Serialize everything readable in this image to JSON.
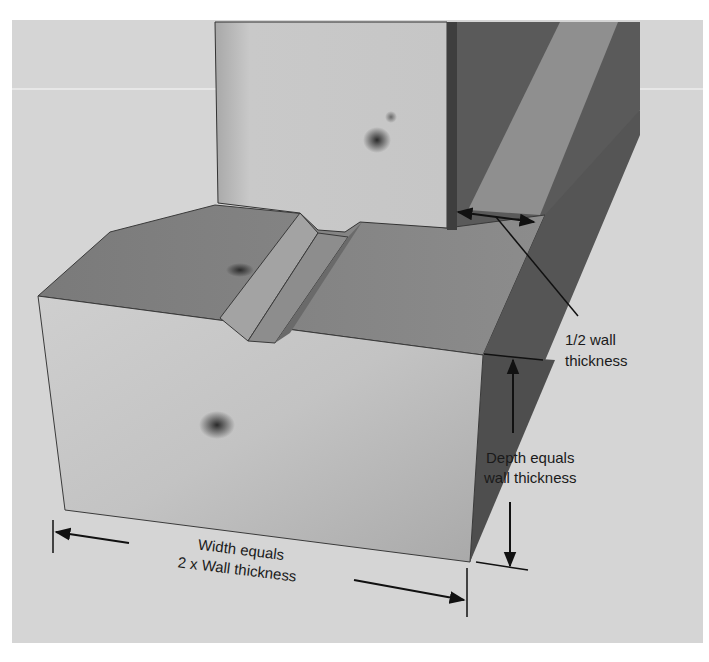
{
  "diagram": {
    "colors": {
      "page_background": "#ffffff",
      "panel_background": "#d6d6d6",
      "front_face": "#bdbdbd",
      "top_surface": "#8a8a8a",
      "side_face": "#5e5e5e",
      "wall_front": "#c4c4c4",
      "wall_side": "#575757",
      "annotation_line": "#111111"
    },
    "annotations": {
      "half_wall": {
        "line1": "1/2 wall",
        "line2": "thickness"
      },
      "depth": {
        "line1": "Depth equals",
        "line2": "wall thickness"
      },
      "width": {
        "line1": "Width equals",
        "line2": "2 x Wall thickness"
      }
    }
  }
}
